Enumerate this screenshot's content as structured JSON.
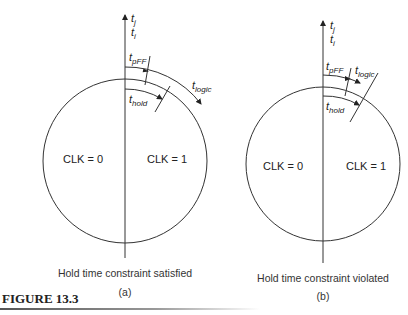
{
  "figure": {
    "label": "FIGURE 13.3",
    "rule_color": "#555555"
  },
  "panels": [
    {
      "id": "a",
      "axis_label_top": "t",
      "axis_sub_top": "j",
      "axis_label_bottom": "t",
      "axis_sub_bottom": "i",
      "tpff": {
        "t": "t",
        "sub": "pFF"
      },
      "tlogic": {
        "t": "t",
        "sub": "logic"
      },
      "thold": {
        "t": "t",
        "sub": "hold"
      },
      "clk0": "CLK = 0",
      "clk1": "CLK = 1",
      "caption": "Hold time constraint satisfied",
      "sublabel": "(a)"
    },
    {
      "id": "b",
      "axis_label_top": "t",
      "axis_sub_top": "j",
      "axis_label_bottom": "t",
      "axis_sub_bottom": "i",
      "tpff": {
        "t": "t",
        "sub": "pFF"
      },
      "tlogic": {
        "t": "t",
        "sub": "logic"
      },
      "thold": {
        "t": "t",
        "sub": "hold"
      },
      "clk0": "CLK = 0",
      "clk1": "CLK = 1",
      "caption": "Hold time constraint violated",
      "sublabel": "(b)"
    }
  ]
}
